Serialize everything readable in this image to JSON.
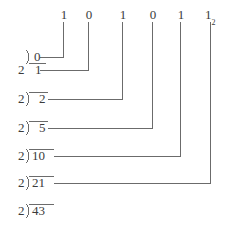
{
  "diagram": {
    "base_subscript": "2",
    "ink_color": "#3b3b3b",
    "line_color": "#6b6b6b",
    "background_color": "#ffffff",
    "bits": [
      {
        "label": "1",
        "x": 63
      },
      {
        "label": "0",
        "x": 88
      },
      {
        "label": "1",
        "x": 122
      },
      {
        "label": "0",
        "x": 152
      },
      {
        "label": "1",
        "x": 180
      },
      {
        "label": "1",
        "x": 210,
        "subscript": "2"
      }
    ],
    "quotient_row": {
      "value": "0",
      "divisor": "2",
      "connector_x": 88,
      "y": 57
    },
    "rows": [
      {
        "divisor": "2",
        "dividend": "1",
        "connector_x": 63,
        "y": 70
      },
      {
        "divisor": "2",
        "dividend": "2",
        "connector_x": 122,
        "y": 99
      },
      {
        "divisor": "2",
        "dividend": "5",
        "connector_x": 152,
        "y": 128
      },
      {
        "divisor": "2",
        "dividend": "10",
        "connector_x": 180,
        "y": 156
      },
      {
        "divisor": "2",
        "dividend": "21",
        "connector_x": 210,
        "y": 183
      },
      {
        "divisor": "2",
        "dividend": "43",
        "connector_x": null,
        "y": 211
      }
    ],
    "result": "101011"
  }
}
